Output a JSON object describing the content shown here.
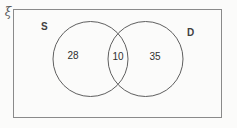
{
  "diagram": {
    "type": "venn",
    "universal_set_symbol": "ξ",
    "sets": [
      {
        "id": "S",
        "label": "S",
        "only_count": "28"
      },
      {
        "id": "D",
        "label": "D",
        "only_count": "35"
      }
    ],
    "intersection_count": "10",
    "regions": [
      {
        "name": "S-only",
        "value": "28"
      },
      {
        "name": "S-and-D",
        "value": "10"
      },
      {
        "name": "D-only",
        "value": "35"
      }
    ],
    "colors": {
      "circle_stroke": "#5f5f5f",
      "rect_stroke": "#8a8a8a",
      "text": "#2f2f2f",
      "background": "#fbfbfa"
    }
  }
}
